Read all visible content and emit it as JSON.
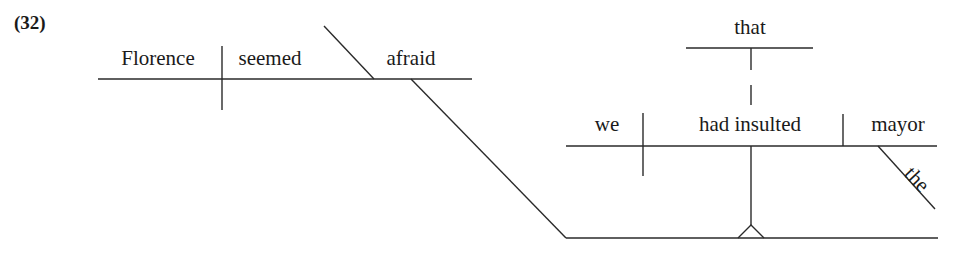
{
  "example_label": "(32)",
  "main_clause": {
    "subject": "Florence",
    "verb": "seemed",
    "predicate_adjective": "afraid"
  },
  "subordinate_clause": {
    "connector": "that",
    "subject": "we",
    "verb": "had insulted",
    "direct_object": "mayor",
    "object_modifier": "the"
  }
}
